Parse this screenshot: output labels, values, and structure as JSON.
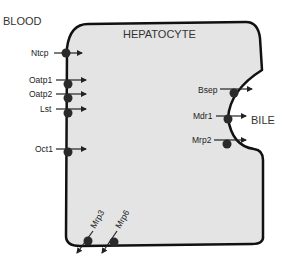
{
  "regions": {
    "blood": "BLOOD",
    "hepatocyte": "HEPATOCYTE",
    "bile": "BILE"
  },
  "colors": {
    "cell_fill": "#e4e4e4",
    "cell_outline": "#111111",
    "transporter": "#2a2a2a",
    "arrow": "#222222"
  },
  "transporters": {
    "basolateral_uptake": [
      {
        "label": "Ntcp"
      },
      {
        "label": "Oatp1"
      },
      {
        "label": "Oatp2"
      },
      {
        "label": "Lst"
      },
      {
        "label": "Oct1"
      }
    ],
    "canalicular_efflux": [
      {
        "label": "Bsep"
      },
      {
        "label": "Mdr1"
      },
      {
        "label": "Mrp2"
      }
    ],
    "basolateral_efflux": [
      {
        "label": "Mrp3"
      },
      {
        "label": "Mrp6"
      }
    ]
  }
}
